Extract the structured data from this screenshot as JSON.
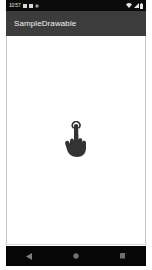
{
  "device": {
    "status_bar": {
      "clock": "10:57",
      "left_icons": [
        "notification-square-icon",
        "notification-square-icon",
        "notification-dot-icon"
      ],
      "right_icons": [
        "wifi-icon",
        "signal-icon",
        "battery-icon"
      ],
      "background_color": "#0b0b0b",
      "text_color": "#e6e6e6"
    },
    "app_bar": {
      "title": "SampleDrawable",
      "background_color": "#3c3c3c",
      "text_color": "#f2f2f2"
    },
    "content": {
      "background_color": "#ffffff",
      "drawable": {
        "name": "pointing-hand-drawable",
        "color": "#333333"
      }
    },
    "nav_bar": {
      "background_color": "#060606",
      "icon_color": "#808080",
      "buttons": [
        {
          "name": "back-button",
          "icon": "back-triangle-icon"
        },
        {
          "name": "home-button",
          "icon": "home-circle-icon"
        },
        {
          "name": "recents-button",
          "icon": "recents-square-icon"
        }
      ]
    }
  }
}
